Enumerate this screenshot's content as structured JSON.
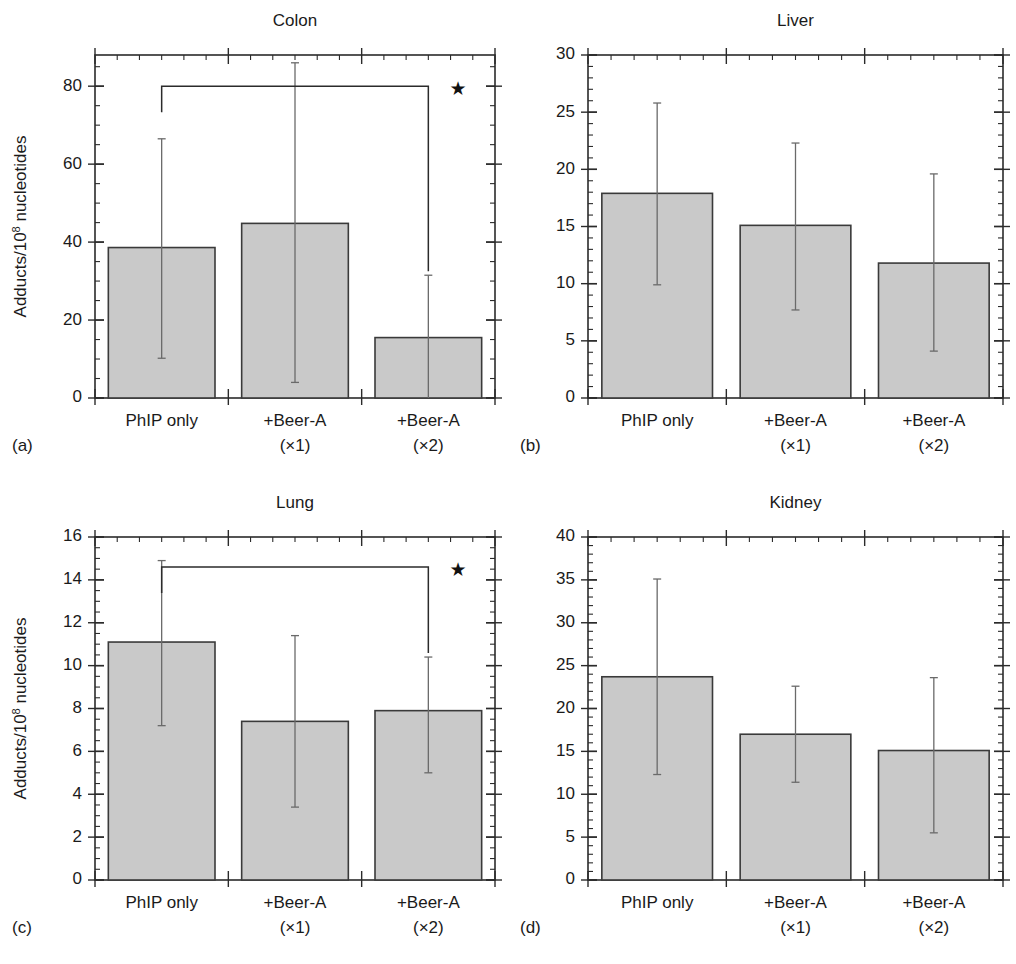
{
  "figure": {
    "ylabel_main": "Adducts/10",
    "ylabel_sup": "8",
    "ylabel_tail": " nucleotides",
    "categories": [
      "PhIP only",
      "+Beer-A",
      "+Beer-A"
    ],
    "category_sub": [
      "",
      "(×1)",
      "(×2)"
    ],
    "bar_fill": "#c9c9c9",
    "bar_stroke": "#3a3a3a",
    "error_color": "#6a6a6a",
    "axis_color": "#2b2b2b",
    "significance_marker": "★",
    "bottom_caption": ""
  },
  "chart_data": [
    {
      "type": "bar",
      "panel": "a",
      "panel_label": "(a)",
      "title": "Colon",
      "xlabel": "",
      "ylabel": "Adducts/10⁸ nucleotides",
      "categories": [
        "PhIP only",
        "+Beer-A (×1)",
        "+Beer-A (×2)"
      ],
      "values": [
        38.6,
        44.8,
        15.5
      ],
      "err_low": [
        10.2,
        4.0,
        0.0
      ],
      "err_high": [
        66.5,
        86.0,
        31.5
      ],
      "ylim": [
        0,
        88
      ],
      "yticks": [
        0,
        20,
        40,
        60,
        80
      ],
      "ytick_labels": [
        "0",
        "20",
        "40",
        "60",
        "80"
      ],
      "minor_tick_step": 5,
      "grid": false,
      "legend": "none",
      "annotations": [
        {
          "kind": "significance-bracket",
          "marker": "★",
          "from_category": "PhIP only",
          "to_category": "+Beer-A (×2)",
          "level": 80
        }
      ]
    },
    {
      "type": "bar",
      "panel": "b",
      "panel_label": "(b)",
      "title": "Liver",
      "xlabel": "",
      "ylabel": "",
      "categories": [
        "PhIP only",
        "+Beer-A (×1)",
        "+Beer-A (×2)"
      ],
      "values": [
        17.9,
        15.1,
        11.8
      ],
      "err_low": [
        9.9,
        7.7,
        4.1
      ],
      "err_high": [
        25.8,
        22.3,
        19.6
      ],
      "ylim": [
        0,
        30
      ],
      "yticks": [
        0,
        5,
        10,
        15,
        20,
        25,
        30
      ],
      "ytick_labels": [
        "0",
        "5",
        "10",
        "15",
        "20",
        "25",
        "30"
      ],
      "minor_tick_step": 1,
      "grid": false,
      "legend": "none",
      "annotations": []
    },
    {
      "type": "bar",
      "panel": "c",
      "panel_label": "(c)",
      "title": "Lung",
      "xlabel": "",
      "ylabel": "Adducts/10⁸ nucleotides",
      "categories": [
        "PhIP only",
        "+Beer-A (×1)",
        "+Beer-A (×2)"
      ],
      "values": [
        11.1,
        7.4,
        7.9
      ],
      "err_low": [
        7.2,
        3.4,
        5.0
      ],
      "err_high": [
        14.9,
        11.4,
        10.4
      ],
      "ylim": [
        0,
        16
      ],
      "yticks": [
        0,
        2,
        4,
        6,
        8,
        10,
        12,
        14,
        16
      ],
      "ytick_labels": [
        "0",
        "2",
        "4",
        "6",
        "8",
        "10",
        "12",
        "14",
        "16"
      ],
      "minor_tick_step": 0.5,
      "grid": false,
      "legend": "none",
      "annotations": [
        {
          "kind": "significance-bracket",
          "marker": "★",
          "from_category": "PhIP only",
          "to_category": "+Beer-A (×2)",
          "level": 14.6
        }
      ]
    },
    {
      "type": "bar",
      "panel": "d",
      "panel_label": "(d)",
      "title": "Kidney",
      "xlabel": "",
      "ylabel": "",
      "categories": [
        "PhIP only",
        "+Beer-A (×1)",
        "+Beer-A (×2)"
      ],
      "values": [
        23.7,
        17.0,
        15.1
      ],
      "err_low": [
        12.3,
        11.4,
        5.5
      ],
      "err_high": [
        35.1,
        22.6,
        23.6
      ],
      "ylim": [
        0,
        40
      ],
      "yticks": [
        0,
        5,
        10,
        15,
        20,
        25,
        30,
        35,
        40
      ],
      "ytick_labels": [
        "0",
        "5",
        "10",
        "15",
        "20",
        "25",
        "30",
        "35",
        "40"
      ],
      "minor_tick_step": 1,
      "grid": false,
      "legend": "none",
      "annotations": []
    }
  ]
}
